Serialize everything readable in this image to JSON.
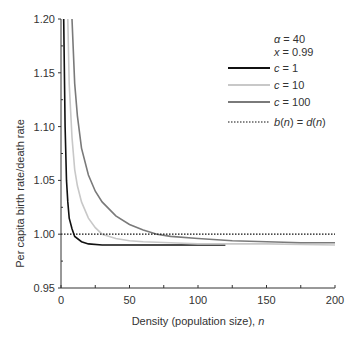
{
  "chart_data": {
    "type": "line",
    "title": "",
    "xlabel": "Density (population size), n",
    "ylabel": "Per capita birth rate/death rate",
    "xlim": [
      0,
      200
    ],
    "ylim": [
      0.95,
      1.2
    ],
    "xticks": [
      "0",
      "50",
      "100",
      "150",
      "200"
    ],
    "yticks": [
      "0.95",
      "1.00",
      "1.05",
      "1.10",
      "1.15",
      "1.20"
    ],
    "grid": false,
    "legend_position": "upper right",
    "annotations": [
      "α = 40",
      "x = 0.99"
    ],
    "series": [
      {
        "name": "c = 1",
        "color": "#111111",
        "style": "solid",
        "x": [
          1,
          2,
          3,
          4,
          5,
          6,
          8,
          10,
          15,
          20,
          30,
          40,
          60,
          80,
          100,
          120
        ],
        "y": [
          1.4,
          1.2,
          1.1,
          1.05,
          1.03,
          1.015,
          1.005,
          0.998,
          0.993,
          0.991,
          0.99,
          0.99,
          0.99,
          0.99,
          0.99,
          0.99
        ]
      },
      {
        "name": "c = 10",
        "color": "#c8c8c8",
        "style": "solid",
        "x": [
          3,
          5,
          6,
          8,
          10,
          12,
          15,
          20,
          25,
          30,
          40,
          50,
          60,
          80,
          100,
          150,
          200
        ],
        "y": [
          1.4,
          1.2,
          1.14,
          1.09,
          1.06,
          1.045,
          1.03,
          1.015,
          1.006,
          1.0,
          0.996,
          0.994,
          0.993,
          0.992,
          0.991,
          0.991,
          0.99
        ]
      },
      {
        "name": "c = 100",
        "color": "#7a7a7a",
        "style": "solid",
        "x": [
          6,
          8,
          10,
          12,
          15,
          20,
          25,
          30,
          40,
          50,
          60,
          70,
          80,
          100,
          125,
          150,
          175,
          200
        ],
        "y": [
          1.3,
          1.2,
          1.14,
          1.11,
          1.08,
          1.055,
          1.04,
          1.03,
          1.017,
          1.009,
          1.004,
          1.0,
          0.998,
          0.996,
          0.994,
          0.993,
          0.992,
          0.992
        ]
      },
      {
        "name": "b(n) = d(n)",
        "color": "#111111",
        "style": "dotted",
        "x": [
          0,
          200
        ],
        "y": [
          1.0,
          1.0
        ]
      }
    ]
  },
  "legend": {
    "alpha": "α = 40",
    "x": "x = 0.99",
    "items": [
      "c = 1",
      "c = 10",
      "c = 100",
      "b(n) = d(n)"
    ]
  }
}
